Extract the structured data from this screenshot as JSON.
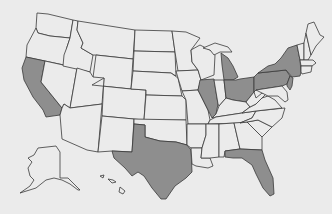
{
  "map": {
    "title": "United States",
    "colors": {
      "background": "#ebebeb",
      "default_fill": "#ebebeb",
      "highlight_fill": "#8e8e8e",
      "outline": "#3a3a3a"
    },
    "highlighted_states": [
      "California",
      "Texas",
      "Florida",
      "Illinois",
      "Michigan",
      "Ohio",
      "Pennsylvania",
      "New York",
      "New Jersey"
    ],
    "states": [
      {
        "name": "Washington",
        "highlighted": false,
        "d": "M37,13 L48,14 L73,20 L70,38 L50,36 L38,33 L36,28 Z"
      },
      {
        "name": "Oregon",
        "highlighted": false,
        "d": "M36,28 L38,33 L50,36 L70,38 L67,47 L64,65 L26,57 L27,45 Z"
      },
      {
        "name": "California",
        "highlighted": true,
        "d": "M26,57 L45,61 L41,82 L62,108 L60,115 L46,117 L43,110 L33,97 L24,80 L22,68 Z"
      },
      {
        "name": "Nevada",
        "highlighted": false,
        "d": "M45,61 L77,68 L70,108 L64,104 L62,108 L41,82 Z"
      },
      {
        "name": "Idaho",
        "highlighted": false,
        "d": "M73,20 L78,21 L77,30 L83,43 L81,48 L93,55 L90,72 L63,66 L64,55 L67,47 L70,38 Z"
      },
      {
        "name": "Montana",
        "highlighted": false,
        "d": "M78,21 L135,30 L133,59 L96,55 L93,55 L81,48 L83,43 L77,30 Z"
      },
      {
        "name": "Wyoming",
        "highlighted": false,
        "d": "M96,55 L133,59 L131,89 L92,85 Z"
      },
      {
        "name": "Utah",
        "highlighted": false,
        "d": "M77,68 L90,72 L93,77 L104,78 L102,104 L70,108 Z"
      },
      {
        "name": "Arizona",
        "highlighted": false,
        "d": "M70,108 L102,104 L98,152 L87,150 L62,139 L60,115 L62,108 L64,104 Z"
      },
      {
        "name": "Colorado",
        "highlighted": false,
        "d": "M104,78 L92,85 L131,89 L146,90 L144,120 L102,116 Z"
      },
      {
        "name": "New Mexico",
        "highlighted": false,
        "d": "M102,116 L134,119 L132,152 L112,151 L98,152 Z"
      },
      {
        "name": "North Dakota",
        "highlighted": false,
        "d": "M135,30 L172,31 L175,52 L134,51 Z"
      },
      {
        "name": "South Dakota",
        "highlighted": false,
        "d": "M134,51 L175,52 L176,76 L171,73 L133,71 Z"
      },
      {
        "name": "Nebraska",
        "highlighted": false,
        "d": "M133,71 L171,73 L178,78 L182,96 L146,95 L146,90 L131,89 Z"
      },
      {
        "name": "Kansas",
        "highlighted": false,
        "d": "M146,95 L182,96 L186,100 L186,120 L144,120 Z"
      },
      {
        "name": "Oklahoma",
        "highlighted": false,
        "d": "M134,119 L186,120 L187,145 L176,142 L160,141 L145,137 L145,125 L134,124 Z"
      },
      {
        "name": "Texas",
        "highlighted": true,
        "d": "M134,124 L145,125 L145,137 L160,141 L176,142 L187,145 L191,150 L192,172 L186,178 L175,186 L166,199 L161,199 L152,188 L144,176 L138,172 L132,176 L125,168 L114,158 L112,151 L132,152 Z"
      },
      {
        "name": "Minnesota",
        "highlighted": false,
        "d": "M172,31 L186,32 L200,38 L191,50 L192,62 L198,70 L178,71 L175,52 Z"
      },
      {
        "name": "Iowa",
        "highlighted": false,
        "d": "M176,71 L198,70 L201,80 L198,90 L182,91 L178,78 Z"
      },
      {
        "name": "Missouri",
        "highlighted": false,
        "d": "M182,91 L198,90 L205,104 L208,110 L210,120 L208,124 L188,124 L186,100 Z"
      },
      {
        "name": "Arkansas",
        "highlighted": false,
        "d": "M187,124 L206,124 L206,135 L202,148 L191,148 L187,145 Z"
      },
      {
        "name": "Louisiana",
        "highlighted": false,
        "d": "M191,148 L202,148 L201,158 L210,158 L213,166 L208,168 L196,166 L192,164 Z"
      },
      {
        "name": "Wisconsin",
        "highlighted": false,
        "d": "M191,50 L200,45 L210,50 L215,55 L214,75 L201,80 L198,70 L192,62 Z"
      },
      {
        "name": "Illinois",
        "highlighted": true,
        "d": "M200,80 L214,79 L218,104 L216,114 L212,118 L208,110 L205,104 L198,90 Z"
      },
      {
        "name": "Michigan",
        "highlighted": true,
        "d": "M221,53 L228,58 L233,66 L238,77 L233,80 L224,80 L222,65 Z"
      },
      {
        "name": "Michigan UP",
        "highlighted": false,
        "d": "M203,48 L215,43 L228,47 L232,52 L220,52 L214,55 L210,50 Z"
      },
      {
        "name": "Indiana",
        "highlighted": false,
        "d": "M214,80 L224,80 L226,98 L219,106 L218,104 Z"
      },
      {
        "name": "Ohio",
        "highlighted": true,
        "d": "M224,80 L236,80 L240,79 L254,77 L254,92 L246,102 L233,100 L226,98 Z"
      },
      {
        "name": "Kentucky",
        "highlighted": false,
        "d": "M212,118 L216,114 L219,106 L226,98 L233,100 L246,102 L250,107 L242,113 L216,117 Z"
      },
      {
        "name": "Tennessee",
        "highlighted": false,
        "d": "M208,124 L210,120 L216,117 L242,113 L256,111 L252,118 L240,123 Z"
      },
      {
        "name": "Mississippi",
        "highlighted": false,
        "d": "M206,124 L219,124 L219,157 L210,158 L201,158 L202,148 L206,135 Z"
      },
      {
        "name": "Alabama",
        "highlighted": false,
        "d": "M219,124 L234,123 L240,149 L225,151 L224,157 L219,157 Z"
      },
      {
        "name": "Georgia",
        "highlighted": false,
        "d": "M234,123 L247,122 L262,137 L262,150 L240,149 Z"
      },
      {
        "name": "Florida",
        "highlighted": true,
        "d": "M225,151 L240,149 L262,150 L265,160 L273,178 L274,194 L270,196 L263,188 L256,174 L252,165 L242,158 L233,158 L225,157 Z"
      },
      {
        "name": "South Carolina",
        "highlighted": false,
        "d": "M247,122 L258,120 L272,127 L262,137 Z"
      },
      {
        "name": "North Carolina",
        "highlighted": false,
        "d": "M240,123 L252,118 L256,111 L285,108 L282,118 L272,127 L258,120 L247,122 Z"
      },
      {
        "name": "Virginia",
        "highlighted": false,
        "d": "M242,113 L250,107 L256,104 L262,98 L268,96 L275,100 L282,108 L256,111 Z"
      },
      {
        "name": "West Virginia",
        "highlighted": false,
        "d": "M246,102 L254,92 L256,98 L262,93 L266,94 L262,98 L256,104 L250,107 Z"
      },
      {
        "name": "Pennsylvania",
        "highlighted": true,
        "d": "M254,77 L258,73 L286,70 L290,76 L287,84 L282,86 L256,90 L254,92 Z"
      },
      {
        "name": "New York",
        "highlighted": true,
        "d": "M258,73 L268,66 L275,64 L281,58 L288,48 L297,45 L300,60 L301,72 L300,76 L292,77 L286,70 Z"
      },
      {
        "name": "New Jersey",
        "highlighted": true,
        "d": "M290,76 L293,78 L292,86 L290,90 L287,86 L287,84 Z"
      },
      {
        "name": "Maryland Delaware",
        "highlighted": false,
        "d": "M256,90 L282,86 L287,92 L288,100 L285,102 L278,96 L268,96 L262,93 Z"
      },
      {
        "name": "Vermont",
        "highlighted": false,
        "d": "M297,45 L304,43 L304,60 L300,60 Z"
      },
      {
        "name": "New Hampshire",
        "highlighted": false,
        "d": "M304,43 L306,33 L311,55 L308,60 L304,60 Z"
      },
      {
        "name": "Maine",
        "highlighted": false,
        "d": "M306,33 L308,24 L314,22 L320,35 L324,37 L316,46 L311,55 Z"
      },
      {
        "name": "Massachusetts",
        "highlighted": false,
        "d": "M300,60 L308,60 L313,60 L316,63 L312,66 L301,66 Z"
      },
      {
        "name": "Connecticut Rhode Island",
        "highlighted": false,
        "d": "M301,66 L312,66 L311,72 L302,74 L301,72 Z"
      },
      {
        "name": "Alaska",
        "highlighted": false,
        "d": "M38,148 L56,146 L60,152 L60,178 L68,178 L76,186 L80,190 L78,190 L70,184 L62,180 L54,178 L46,180 L36,188 L20,193 L30,186 L34,180 L30,176 L28,168 L32,162 L28,158 L34,155 Z"
      },
      {
        "name": "Hawaii",
        "highlighted": false,
        "d": "M100,176 L104,175 L103,178 Z M108,179 L113,180 L116,182 L112,183 Z M120,187 L125,191 L123,194 L119,192 Z"
      }
    ]
  }
}
